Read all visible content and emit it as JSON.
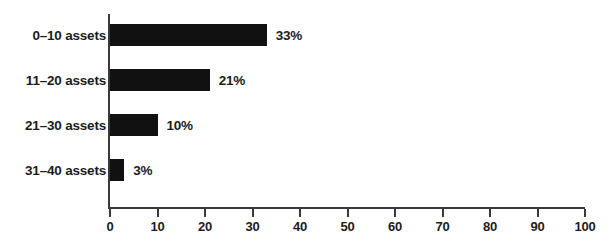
{
  "chart_data": {
    "type": "bar",
    "orientation": "horizontal",
    "title": "",
    "subtitle": "",
    "xlabel": "",
    "ylabel": "",
    "categories": [
      "0–10 assets",
      "11–20 assets",
      "21–30 assets",
      "31–40 assets"
    ],
    "values": [
      33,
      21,
      10,
      3
    ],
    "value_labels": [
      "33%",
      "21%",
      "10%",
      "3%"
    ],
    "xlim": [
      0,
      100
    ],
    "xticks": [
      0,
      10,
      20,
      30,
      40,
      50,
      60,
      70,
      80,
      90,
      100
    ],
    "xtick_labels": [
      "0",
      "10",
      "20",
      "30",
      "40",
      "50",
      "60",
      "70",
      "80",
      "90",
      "100"
    ],
    "grid": false,
    "legend": null,
    "annotations": [],
    "colors": {
      "bar": "#111111",
      "axis": "#3a3a3a",
      "text": "#1c1c1c",
      "background": "#ffffff"
    }
  }
}
